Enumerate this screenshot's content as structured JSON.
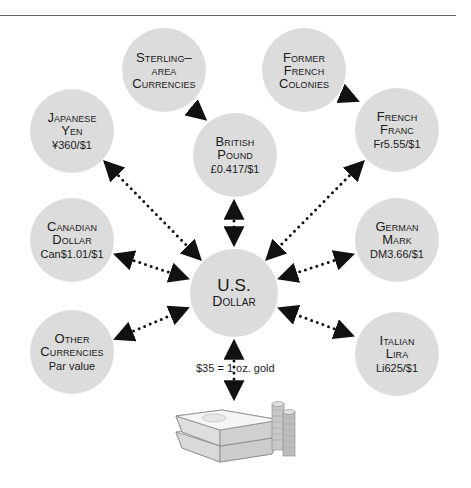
{
  "diagram": {
    "title": "",
    "center": {
      "id": "usd",
      "name_line1": "U.S.",
      "name_line2": "Dollar"
    },
    "nodes": [
      {
        "id": "sterling_area",
        "line1": "Sterling–",
        "line2": "area",
        "line3": "Currencies",
        "rate": ""
      },
      {
        "id": "former_french",
        "line1": "Former",
        "line2": "French",
        "line3": "Colonies",
        "rate": ""
      },
      {
        "id": "yen",
        "line1": "Japanese",
        "line2": "Yen",
        "rate": "¥360/$1"
      },
      {
        "id": "pound",
        "line1": "British",
        "line2": "Pound",
        "rate": "£0.417/$1"
      },
      {
        "id": "franc",
        "line1": "French",
        "line2": "Franc",
        "rate": "Fr5.55/$1"
      },
      {
        "id": "cad",
        "line1": "Canadian",
        "line2": "Dollar",
        "rate": "Can$1.01/$1"
      },
      {
        "id": "mark",
        "line1": "German",
        "line2": "Mark",
        "rate": "DM3.66/$1"
      },
      {
        "id": "other",
        "line1": "Other",
        "line2": "Currencies",
        "rate": "Par value"
      },
      {
        "id": "lira",
        "line1": "Italian",
        "line2": "Lira",
        "rate": "Li625/$1"
      }
    ],
    "links": [
      {
        "from": "sterling_area",
        "to": "pound",
        "style": "dotted-arrow",
        "direction": "one-way"
      },
      {
        "from": "former_french",
        "to": "franc",
        "style": "dotted-arrow",
        "direction": "one-way"
      },
      {
        "from": "yen",
        "to": "usd",
        "style": "dotted-arrow",
        "direction": "two-way"
      },
      {
        "from": "pound",
        "to": "usd",
        "style": "dotted-arrow",
        "direction": "two-way"
      },
      {
        "from": "franc",
        "to": "usd",
        "style": "dotted-arrow",
        "direction": "two-way"
      },
      {
        "from": "cad",
        "to": "usd",
        "style": "dotted-arrow",
        "direction": "two-way"
      },
      {
        "from": "mark",
        "to": "usd",
        "style": "dotted-arrow",
        "direction": "two-way"
      },
      {
        "from": "other",
        "to": "usd",
        "style": "dotted-arrow",
        "direction": "two-way"
      },
      {
        "from": "lira",
        "to": "usd",
        "style": "dotted-arrow",
        "direction": "two-way"
      },
      {
        "from": "usd",
        "to": "gold",
        "style": "dotted-arrow",
        "direction": "two-way"
      }
    ],
    "gold_link_label": "$35 = 1 oz. gold",
    "gold_icon": "gold-bars-and-coins-icon",
    "colors": {
      "node_fill": "#dcdcdc",
      "link": "#111111",
      "rule": "#666666"
    }
  }
}
